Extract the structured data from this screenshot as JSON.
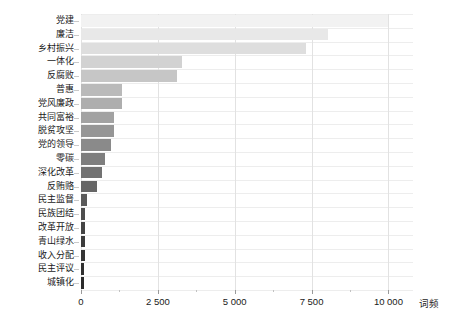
{
  "chart_data": {
    "type": "bar",
    "orientation": "horizontal",
    "title": "",
    "xlabel": "词频",
    "ylabel": "",
    "xlim": [
      0,
      10800
    ],
    "xticks": [
      0,
      2500,
      5000,
      7500,
      10000
    ],
    "xtick_labels": [
      "0",
      "2 500",
      "5 000",
      "7 500",
      "10 000"
    ],
    "grid": "both-light",
    "legend": "none",
    "categories": [
      "党建",
      "廉洁",
      "乡村振兴",
      "一体化",
      "反腐败",
      "普惠",
      "党风廉政",
      "共同富裕",
      "脱贫攻坚",
      "党的领导",
      "零碳",
      "深化改革",
      "反贿赂",
      "民主监督",
      "民族团结",
      "改革开放",
      "青山绿水",
      "收入分配",
      "民主评议",
      "城镇化"
    ],
    "values": [
      10000,
      8050,
      7320,
      3280,
      3130,
      1330,
      1330,
      1080,
      1080,
      990,
      780,
      690,
      510,
      180,
      130,
      125,
      120,
      115,
      110,
      105
    ],
    "bar_colors": [
      "#f2f2f2",
      "#e8e8e8",
      "#dedede",
      "#d2d2d2",
      "#c6c6c6",
      "#bababa",
      "#aeaeae",
      "#a2a2a2",
      "#969696",
      "#8a8a8a",
      "#7e7e7e",
      "#727272",
      "#666666",
      "#5a5a5a",
      "#4e4e4e",
      "#444444",
      "#3c3c3c",
      "#353535",
      "#303030",
      "#2b2b2b"
    ],
    "gridline_color": "#e2e2e2",
    "text_color": "#1a1a1a",
    "background": "#ffffff"
  }
}
